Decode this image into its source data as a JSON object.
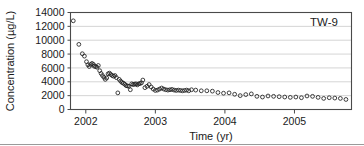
{
  "chart_data": {
    "type": "scatter",
    "title": "",
    "annotation": "TW-9",
    "xlabel": "Time (yr)",
    "ylabel": "Concentration (µg/L)",
    "xlim": [
      2001.78,
      2005.82
    ],
    "ylim": [
      0,
      14000
    ],
    "xticks": [
      2002,
      2003,
      2004,
      2005
    ],
    "xtick_labels": [
      "2002",
      "2003",
      "2004",
      "2005"
    ],
    "yticks": [
      0,
      2000,
      4000,
      6000,
      8000,
      10000,
      12000,
      14000
    ],
    "ytick_labels": [
      "0",
      "2000",
      "4000",
      "6000",
      "8000",
      "10000",
      "12000",
      "14000"
    ],
    "grid": "horizontal",
    "legend_position": "none",
    "marker": "open-circle",
    "series": [
      {
        "name": "TW-9",
        "x": [
          2001.82,
          2001.9,
          2001.95,
          2001.98,
          2002.01,
          2002.03,
          2002.05,
          2002.07,
          2002.09,
          2002.11,
          2002.12,
          2002.14,
          2002.16,
          2002.18,
          2002.2,
          2002.22,
          2002.24,
          2002.26,
          2002.28,
          2002.3,
          2002.32,
          2002.34,
          2002.36,
          2002.38,
          2002.4,
          2002.42,
          2002.44,
          2002.46,
          2002.48,
          2002.5,
          2002.52,
          2002.54,
          2002.56,
          2002.58,
          2002.6,
          2002.62,
          2002.64,
          2002.66,
          2002.68,
          2002.7,
          2002.72,
          2002.74,
          2002.76,
          2002.78,
          2002.8,
          2002.82,
          2002.85,
          2002.88,
          2002.91,
          2002.94,
          2002.97,
          2003.0,
          2003.03,
          2003.06,
          2003.09,
          2003.12,
          2003.15,
          2003.18,
          2003.21,
          2003.24,
          2003.27,
          2003.3,
          2003.33,
          2003.36,
          2003.39,
          2003.42,
          2003.45,
          2003.48,
          2003.52,
          2003.58,
          2003.66,
          2003.74,
          2003.82,
          2003.9,
          2003.98,
          2004.06,
          2004.14,
          2004.22,
          2004.3,
          2004.38,
          2004.46,
          2004.54,
          2004.62,
          2004.7,
          2004.78,
          2004.86,
          2004.94,
          2005.02,
          2005.1,
          2005.18,
          2005.26,
          2005.34,
          2005.42,
          2005.5,
          2005.58,
          2005.66,
          2005.74
        ],
        "y": [
          12800,
          9400,
          8050,
          7700,
          6900,
          6450,
          6200,
          6500,
          6650,
          6500,
          6250,
          6200,
          6100,
          6350,
          5600,
          5200,
          4900,
          4650,
          4350,
          4550,
          5150,
          5250,
          5050,
          4900,
          4800,
          4900,
          4600,
          2400,
          4350,
          4100,
          3900,
          3800,
          3650,
          3450,
          3400,
          3350,
          2850,
          3700,
          3600,
          3650,
          3700,
          3550,
          3700,
          3750,
          3850,
          4250,
          3150,
          3350,
          3600,
          3250,
          2950,
          2750,
          2800,
          2950,
          3100,
          2950,
          2850,
          2800,
          2850,
          2900,
          2800,
          2750,
          2800,
          2750,
          2700,
          2750,
          2800,
          2700,
          2850,
          2800,
          2700,
          2700,
          2650,
          2450,
          2350,
          2400,
          2200,
          2000,
          2150,
          2250,
          1900,
          1800,
          1950,
          1900,
          1850,
          1800,
          1750,
          1800,
          1700,
          1950,
          1900,
          1750,
          1600,
          1700,
          1650,
          1600,
          1450
        ]
      }
    ]
  },
  "figure": {
    "y_axis_title": "Concentration (µg/L)",
    "x_axis_title": "Time (yr)",
    "panel_label": "TW-9"
  }
}
